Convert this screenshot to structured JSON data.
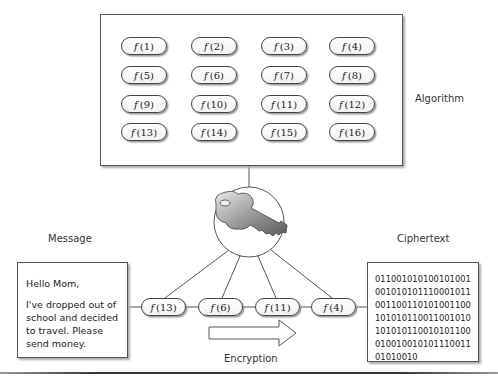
{
  "algorithm": {
    "label": "Algorithm",
    "functions": [
      {
        "f": "f",
        "arg": "(1)"
      },
      {
        "f": "f",
        "arg": "(2)"
      },
      {
        "f": "f",
        "arg": "(3)"
      },
      {
        "f": "f",
        "arg": "(4)"
      },
      {
        "f": "f",
        "arg": "(5)"
      },
      {
        "f": "f",
        "arg": "(6)"
      },
      {
        "f": "f",
        "arg": "(7)"
      },
      {
        "f": "f",
        "arg": "(8)"
      },
      {
        "f": "f",
        "arg": "(9)"
      },
      {
        "f": "f",
        "arg": "(10)"
      },
      {
        "f": "f",
        "arg": "(11)"
      },
      {
        "f": "f",
        "arg": "(12)"
      },
      {
        "f": "f",
        "arg": "(13)"
      },
      {
        "f": "f",
        "arg": "(14)"
      },
      {
        "f": "f",
        "arg": "(15)"
      },
      {
        "f": "f",
        "arg": "(16)"
      }
    ]
  },
  "key": {
    "icon": "key-icon"
  },
  "message": {
    "label": "Message",
    "greeting": "Hello Mom,",
    "body": [
      "I've dropped out of",
      "school and decided",
      "to travel. Please",
      "send money."
    ]
  },
  "chain": {
    "functions": [
      {
        "f": "f",
        "arg": "(13)"
      },
      {
        "f": "f",
        "arg": "(6)"
      },
      {
        "f": "f",
        "arg": "(11)"
      },
      {
        "f": "f",
        "arg": "(4)"
      }
    ],
    "arrow_label": "Encryption"
  },
  "ciphertext": {
    "label": "Ciphertext",
    "lines": [
      "011001010100101001",
      "001010101110001011",
      "001100110101001100",
      "101010110011001010",
      "101010110010101100",
      "010010010101110011",
      "01010010"
    ]
  }
}
